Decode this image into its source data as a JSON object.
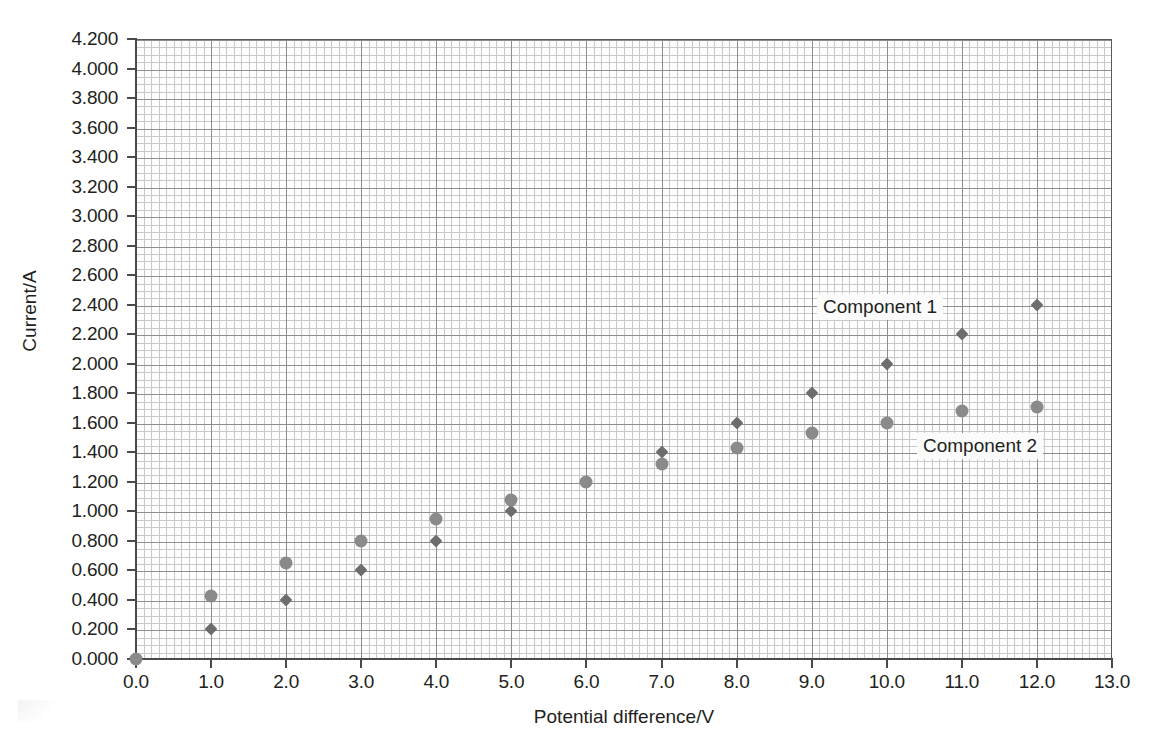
{
  "chart_data": {
    "type": "scatter",
    "title": "",
    "xlabel": "Potential difference/V",
    "ylabel": "Current/A",
    "xlim": [
      0.0,
      13.0
    ],
    "ylim": [
      0.0,
      4.2
    ],
    "xticks": [
      "0.0",
      "1.0",
      "2.0",
      "3.0",
      "4.0",
      "5.0",
      "6.0",
      "7.0",
      "8.0",
      "9.0",
      "10.0",
      "11.0",
      "12.0",
      "13.0"
    ],
    "yticks": [
      "0.000",
      "0.200",
      "0.400",
      "0.600",
      "0.800",
      "1.000",
      "1.200",
      "1.400",
      "1.600",
      "1.800",
      "2.000",
      "2.200",
      "2.400",
      "2.600",
      "2.800",
      "3.000",
      "3.200",
      "3.400",
      "3.600",
      "3.800",
      "4.000",
      "4.200"
    ],
    "xtick_values": [
      0,
      1,
      2,
      3,
      4,
      5,
      6,
      7,
      8,
      9,
      10,
      11,
      12,
      13
    ],
    "ytick_values": [
      0.0,
      0.2,
      0.4,
      0.6,
      0.8,
      1.0,
      1.2,
      1.4,
      1.6,
      1.8,
      2.0,
      2.2,
      2.4,
      2.6,
      2.8,
      3.0,
      3.2,
      3.4,
      3.6,
      3.8,
      4.0,
      4.2
    ],
    "grid": true,
    "minor_grid": true,
    "minor_per_major_x": 10,
    "minor_per_major_y": 4,
    "legend_position": "inline-annotation",
    "series": [
      {
        "name": "Component 1",
        "marker": "small-diamond",
        "color": "#6d6d6d",
        "x": [
          0.0,
          1.0,
          2.0,
          3.0,
          4.0,
          5.0,
          6.0,
          7.0,
          8.0,
          9.0,
          10.0,
          11.0,
          12.0
        ],
        "y": [
          0.0,
          0.2,
          0.4,
          0.6,
          0.8,
          1.0,
          1.2,
          1.4,
          1.6,
          1.8,
          2.0,
          2.2,
          2.4
        ]
      },
      {
        "name": "Component 2",
        "marker": "large-circle",
        "color": "#8a8a8a",
        "x": [
          0.0,
          1.0,
          2.0,
          3.0,
          4.0,
          5.0,
          6.0,
          7.0,
          8.0,
          9.0,
          10.0,
          11.0,
          12.0
        ],
        "y": [
          0.0,
          0.43,
          0.65,
          0.8,
          0.95,
          1.08,
          1.2,
          1.32,
          1.43,
          1.53,
          1.6,
          1.68,
          1.71
        ]
      }
    ],
    "annotations": [
      {
        "text": "Component 1",
        "series": "Component 1"
      },
      {
        "text": "Component 2",
        "series": "Component 2"
      }
    ]
  }
}
